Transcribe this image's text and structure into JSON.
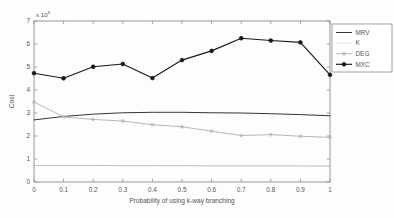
{
  "figure": {
    "background_color": "#fdfdfd",
    "axis_color": "#8d8d8d",
    "text_color": "#555555"
  },
  "axes": {
    "exponent_prefix": "x 10",
    "exponent_power": "8",
    "ylabel": "Cost",
    "xlabel": "Probability of using k-way branching",
    "xticks": [
      "0",
      "0.1",
      "0.2",
      "0.3",
      "0.4",
      "0.5",
      "0.6",
      "0.7",
      "0.8",
      "0.9",
      "1"
    ],
    "yticks": [
      "0",
      "1",
      "2",
      "3",
      "4",
      "5",
      "6",
      "7"
    ]
  },
  "legend": {
    "position": "upper-right-outside",
    "entries": [
      {
        "label": "MRV",
        "style": "solid",
        "color": "#2b2b2b",
        "marker": "none"
      },
      {
        "label": "K",
        "style": "dotted",
        "color": "#9a9a9a",
        "marker": "none"
      },
      {
        "label": "DEG",
        "style": "solid",
        "color": "#b4b4b4",
        "marker": "star"
      },
      {
        "label": "MXC",
        "style": "solid",
        "color": "#1a1a1a",
        "marker": "circle"
      }
    ]
  },
  "chart_data": {
    "type": "line",
    "title": "",
    "xlabel": "Probability of using k-way branching",
    "ylabel": "Cost",
    "y_exponent": 8,
    "xlim": [
      0,
      1
    ],
    "ylim": [
      0,
      7
    ],
    "grid": false,
    "legend_position": "upper right outside",
    "x": [
      0,
      0.1,
      0.2,
      0.3,
      0.4,
      0.5,
      0.6,
      0.7,
      0.8,
      0.9,
      1
    ],
    "series": [
      {
        "name": "MRV",
        "color": "#2b2b2b",
        "style": "solid",
        "marker": "none",
        "values": [
          2.7,
          2.85,
          2.95,
          3.01,
          3.03,
          3.03,
          3.01,
          3.0,
          2.97,
          2.93,
          2.88
        ]
      },
      {
        "name": "K",
        "color": "#9a9a9a",
        "style": "dotted",
        "marker": "none",
        "values": [
          0.72,
          0.72,
          0.72,
          0.71,
          0.71,
          0.71,
          0.7,
          0.7,
          0.7,
          0.7,
          0.69
        ]
      },
      {
        "name": "DEG",
        "color": "#b4b4b4",
        "style": "solid",
        "marker": "star",
        "values": [
          3.48,
          2.83,
          2.72,
          2.65,
          2.49,
          2.4,
          2.21,
          2.02,
          2.06,
          1.99,
          1.94
        ]
      },
      {
        "name": "MXC",
        "color": "#1a1a1a",
        "style": "solid",
        "marker": "circle",
        "values": [
          4.73,
          4.51,
          5.01,
          5.13,
          4.52,
          5.3,
          5.7,
          6.25,
          6.15,
          6.07,
          4.66
        ]
      }
    ]
  }
}
